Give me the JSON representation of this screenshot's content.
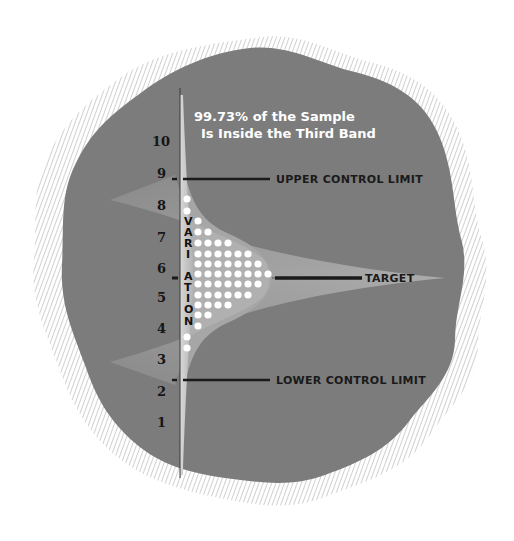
{
  "title": {
    "line1": "99.73% of the Sample",
    "line2": "Is Inside the Third Band"
  },
  "axis": {
    "label_letters": [
      "V",
      "A",
      "R",
      "I",
      "A",
      "T",
      "I",
      "O",
      "N"
    ],
    "ticks": [
      "10",
      "9",
      "8",
      "7",
      "6",
      "5",
      "4",
      "3",
      "2",
      "1"
    ]
  },
  "lines": {
    "upper": "UPPER CONTROL LIMIT",
    "target": "TARGET",
    "lower": "LOWER CONTROL LIMIT"
  },
  "colors": {
    "blob": "#7a7a7a",
    "band": "#a9a9a9",
    "inner_band": "#bcbcbc",
    "dot": "#ffffff",
    "line": "#1a1a1a",
    "hatch": "#bdbdbd"
  },
  "chart_data": {
    "type": "dot-histogram",
    "title": "99.73% of the Sample Is Inside the Third Band",
    "ylabel": "VARIATION",
    "y_ticks": [
      1,
      2,
      3,
      4,
      5,
      6,
      7,
      8,
      9,
      10
    ],
    "upper_control_limit": 8.8,
    "target": 5.6,
    "lower_control_limit": 2.4,
    "rows_top_to_bottom_dot_counts": [
      1,
      1,
      1,
      2,
      4,
      6,
      7,
      8,
      7,
      6,
      4,
      2,
      1,
      1,
      1
    ],
    "annotations": [
      "UPPER CONTROL LIMIT",
      "TARGET",
      "LOWER CONTROL LIMIT"
    ]
  }
}
